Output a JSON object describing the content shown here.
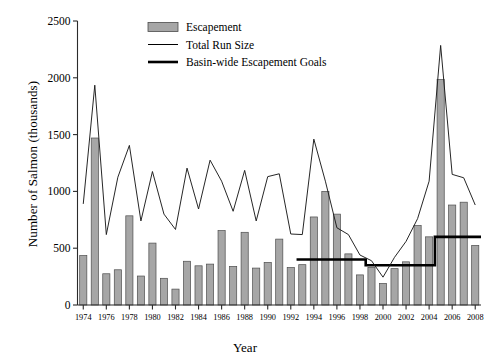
{
  "chart_data": {
    "type": "bar",
    "title": "",
    "xlabel": "Year",
    "ylabel": "Number of Salmon (thousands)",
    "ylim": [
      0,
      2500
    ],
    "yticks": [
      0,
      500,
      1000,
      1500,
      2000,
      2500
    ],
    "xlim": [
      1974,
      2008
    ],
    "xticks": [
      1974,
      1976,
      1978,
      1980,
      1982,
      1984,
      1986,
      1988,
      1990,
      1992,
      1994,
      1996,
      1998,
      2000,
      2002,
      2004,
      2006,
      2008
    ],
    "grid": false,
    "legend_position": "top-center",
    "categories": [
      1974,
      1975,
      1976,
      1977,
      1978,
      1979,
      1980,
      1981,
      1982,
      1983,
      1984,
      1985,
      1986,
      1987,
      1988,
      1989,
      1990,
      1991,
      1992,
      1993,
      1994,
      1995,
      1996,
      1997,
      1998,
      1999,
      2000,
      2001,
      2002,
      2003,
      2004,
      2005,
      2006,
      2007,
      2008
    ],
    "series": [
      {
        "name": "Escapement",
        "type": "bar",
        "values": [
          435,
          1470,
          275,
          310,
          785,
          255,
          545,
          235,
          140,
          385,
          345,
          360,
          655,
          340,
          640,
          325,
          375,
          580,
          330,
          355,
          775,
          1000,
          800,
          450,
          265,
          330,
          190,
          320,
          380,
          700,
          600,
          1985,
          880,
          905,
          525
        ]
      },
      {
        "name": "Total Run Size",
        "type": "line",
        "values": [
          890,
          1935,
          620,
          1125,
          1405,
          740,
          1175,
          800,
          665,
          1205,
          845,
          1275,
          1090,
          825,
          1185,
          740,
          1130,
          1155,
          625,
          620,
          1460,
          1090,
          680,
          620,
          440,
          390,
          245,
          420,
          560,
          760,
          1090,
          2285,
          1150,
          1120,
          880
        ]
      },
      {
        "name": "Basin-wide Escapement Goals",
        "type": "step-line",
        "values": [
          null,
          null,
          null,
          null,
          null,
          null,
          null,
          null,
          null,
          null,
          null,
          null,
          null,
          null,
          null,
          null,
          null,
          null,
          null,
          400,
          400,
          400,
          400,
          400,
          400,
          350,
          350,
          350,
          350,
          350,
          350,
          600,
          600,
          600,
          600
        ]
      }
    ]
  },
  "legend": {
    "items": [
      {
        "label": "Escapement",
        "marker": "filled-rect",
        "color": "#a6a6a6"
      },
      {
        "label": "Total Run Size",
        "marker": "thin-line",
        "color": "#000000"
      },
      {
        "label": "Basin-wide Escapement Goals",
        "marker": "thick-line",
        "color": "#000000"
      }
    ]
  },
  "colors": {
    "bar_fill": "#a6a6a6",
    "bar_stroke": "#4d4d4d",
    "run_line": "#1a1a1a",
    "goal_line": "#000000",
    "axis": "#2b2b2b",
    "background": "#ffffff"
  }
}
